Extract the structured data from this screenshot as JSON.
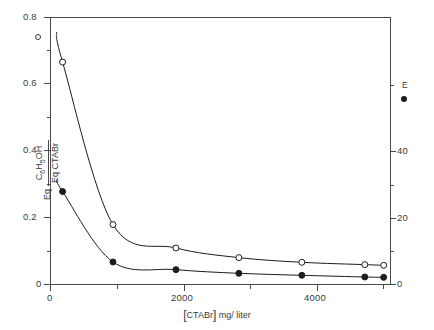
{
  "chart_data": {
    "type": "line",
    "title": "",
    "xlabel": "[CTABr] mg/liter",
    "ylabel_numerator": "Eq C6H5OH",
    "ylabel_denominator": "Eq CTABr",
    "ylabel_right": "",
    "xlim": [
      0,
      5400
    ],
    "ylim": [
      0,
      0.8
    ],
    "ylim_right": [
      0,
      52
    ],
    "grid": false,
    "legend_position": "inside-left-top / right-margin",
    "xticks": [
      0,
      1000,
      2000,
      3000,
      4000,
      5000
    ],
    "xticklabels": [
      "0",
      "",
      "2000",
      "",
      "4000",
      ""
    ],
    "yticks": [
      0,
      0.1,
      0.2,
      0.3,
      0.4,
      0.5,
      0.6,
      0.7,
      0.8
    ],
    "yticklabels": [
      "0",
      "",
      "0.2",
      "",
      "0.4",
      "",
      "0.6",
      "",
      "0.8"
    ],
    "yticks_right": [
      0,
      10,
      20,
      30,
      40,
      50
    ],
    "yticklabels_right": [
      "0",
      "",
      "20",
      "",
      "40",
      ""
    ],
    "series": [
      {
        "name": "open-circle-series",
        "marker": "open-circle",
        "color": "#1d1d1d",
        "x": [
          200,
          1000,
          2000,
          3000,
          4000,
          5000,
          5300
        ],
        "y": [
          0.665,
          0.178,
          0.108,
          0.079,
          0.065,
          0.058,
          0.056
        ]
      },
      {
        "name": "filled-circle-series",
        "marker": "filled-circle",
        "color": "#1d1d1d",
        "x": [
          200,
          1000,
          2000,
          3000,
          4000,
          5000,
          5300
        ],
        "y": [
          0.277,
          0.066,
          0.043,
          0.032,
          0.026,
          0.021,
          0.02
        ]
      }
    ],
    "annotations": [
      {
        "name": "legend-open-marker",
        "symbol": "open-circle",
        "x_px": 38,
        "y_px": 37
      },
      {
        "name": "legend-label-E",
        "text": "E",
        "x_px": 404,
        "y_px": 85
      },
      {
        "name": "legend-filled-marker",
        "symbol": "filled-circle",
        "x_px": 404,
        "y_px": 99
      }
    ]
  },
  "axes": {
    "x_tick_labels": [
      {
        "value": "0",
        "px": 50
      },
      {
        "value": "2000",
        "px": 184
      },
      {
        "value": "4000",
        "px": 317
      }
    ],
    "y_tick_labels_left": [
      {
        "value": "0.8",
        "px": 17
      },
      {
        "value": "0.6",
        "px": 83
      },
      {
        "value": "0.4",
        "px": 150
      },
      {
        "value": "0.2",
        "px": 217
      },
      {
        "value": "0",
        "px": 284
      }
    ],
    "y_tick_labels_right": [
      {
        "value": "40",
        "px": 151
      },
      {
        "value": "20",
        "px": 218
      },
      {
        "value": "0",
        "px": 284
      }
    ],
    "x_axis_title": "mg/ liter",
    "x_axis_bracket_term": "CTABr",
    "y_axis_numerator_prefix": "Eq",
    "y_axis_numerator_formula": "C6H5OH",
    "y_axis_denominator": "Eq CTABr",
    "legend_letter": "E"
  }
}
